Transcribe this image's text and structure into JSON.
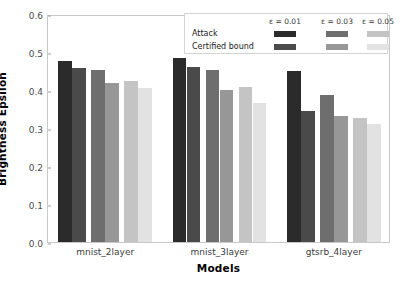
{
  "chart_data": {
    "type": "bar",
    "title": "",
    "xlabel": "Models",
    "ylabel": "Brightness Epsilon",
    "categories": [
      "mnist_2layer",
      "mnist_3layer",
      "gtsrb_4layer"
    ],
    "ylim": [
      0.0,
      0.6
    ],
    "yticks": [
      "0.0",
      "0.1",
      "0.2",
      "0.3",
      "0.4",
      "0.5",
      "0.6"
    ],
    "ytick_values": [
      0.0,
      0.1,
      0.2,
      0.3,
      0.4,
      0.5,
      0.6
    ],
    "grid": false,
    "legend_position": "upper right",
    "legend": {
      "column_headers": [
        "ε = 0.01",
        "ε = 0.03",
        "ε = 0.05"
      ],
      "row_labels": [
        "Attack",
        "Certified bound"
      ]
    },
    "series": [
      {
        "name": "Attack ε = 0.01",
        "color": "#2b2b2b",
        "values": [
          0.477,
          0.484,
          0.45
        ]
      },
      {
        "name": "Certified bound ε = 0.01",
        "color": "#4a4a4a",
        "values": [
          0.457,
          0.461,
          0.346
        ]
      },
      {
        "name": "Attack ε = 0.03",
        "color": "#6e6e6e",
        "values": [
          0.453,
          0.453,
          0.387
        ]
      },
      {
        "name": "Certified bound ε = 0.03",
        "color": "#979797",
        "values": [
          0.418,
          0.401,
          0.332
        ]
      },
      {
        "name": "Attack ε = 0.05",
        "color": "#c4c4c4",
        "values": [
          0.424,
          0.408,
          0.327
        ]
      },
      {
        "name": "Certified bound ε = 0.05",
        "color": "#e2e2e2",
        "values": [
          0.406,
          0.366,
          0.311
        ]
      }
    ]
  }
}
